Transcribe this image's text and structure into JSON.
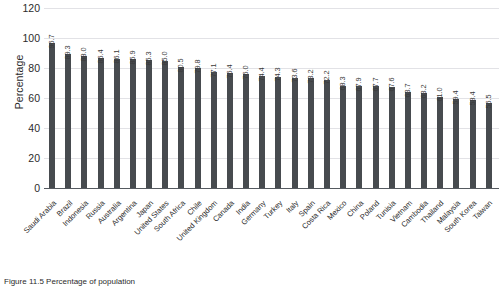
{
  "chart_data": {
    "type": "bar",
    "title": "",
    "xlabel": "",
    "ylabel": "Percentage",
    "ylim": [
      0,
      120
    ],
    "ytick_values": [
      120,
      100,
      80,
      60,
      40,
      20,
      0
    ],
    "grid": true,
    "legend": "none",
    "bar_color": "#474b4f",
    "categories": [
      "Saudi Arabia",
      "Brazil",
      "Indonesia",
      "Russia",
      "Australia",
      "Argentina",
      "Japan",
      "United States",
      "South Africa",
      "Chile",
      "United Kingdom",
      "Canada",
      "India",
      "Germany",
      "Turkey",
      "Italy",
      "Spain",
      "Costa Rica",
      "Mexico",
      "China",
      "Poland",
      "Tunisia",
      "Vietnam",
      "Cambodia",
      "Thailand",
      "Malaysia",
      "South Korea",
      "Taiwan"
    ],
    "values": [
      96.7,
      89.3,
      88.0,
      86.4,
      86.1,
      85.9,
      85.3,
      85.0,
      80.5,
      79.8,
      77.1,
      76.4,
      76.0,
      74.4,
      74.3,
      73.6,
      73.2,
      72.2,
      68.3,
      67.9,
      67.7,
      67.6,
      63.7,
      63.2,
      61.0,
      59.4,
      58.4,
      56.5
    ],
    "value_labels": [
      "96.7",
      "89.3",
      "88.0",
      "86.4",
      "86.1",
      "85.9",
      "85.3",
      "85.0",
      "80.5",
      "79.8",
      "77.1",
      "76.4",
      "76.0",
      "74.4",
      "74.3",
      "73.6",
      "73.2",
      "72.2",
      "68.3",
      "67.9",
      "67.7",
      "67.6",
      "63.7",
      "63.2",
      "61.0",
      "59.4",
      "58.4",
      "56.5"
    ]
  },
  "caption": {
    "text": "Figure 11.5 Percentage of population"
  }
}
